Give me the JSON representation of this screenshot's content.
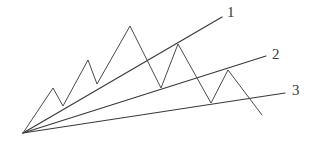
{
  "figure": {
    "background_color": "#ffffff",
    "line_color": "#3a3a3a",
    "zigzag_color": "#4a4a4a",
    "width": 318,
    "height": 145,
    "apex": {
      "x": 23,
      "y": 133
    }
  },
  "labels": {
    "line1": "1",
    "line2": "2",
    "line3": "3"
  },
  "chart_data": {
    "type": "line",
    "xlabel": "",
    "ylabel": "",
    "xlim": [
      0,
      318
    ],
    "ylim": [
      145,
      0
    ],
    "grid": false,
    "legend": "right-end-labels",
    "note": "Coordinates are in screen pixels; y increases downward.",
    "apex": {
      "x": 23,
      "y": 133
    },
    "series": [
      {
        "name": "1",
        "role": "upper-trendline",
        "label": "1",
        "label_position": {
          "x": 227,
          "y": 14
        },
        "points": [
          [
            23,
            133
          ],
          [
            222,
            17
          ]
        ]
      },
      {
        "name": "2",
        "role": "middle-trendline",
        "label": "2",
        "label_position": {
          "x": 272,
          "y": 56
        },
        "points": [
          [
            23,
            133
          ],
          [
            266,
            56
          ]
        ]
      },
      {
        "name": "3",
        "role": "lower-trendline",
        "label": "3",
        "label_position": {
          "x": 292,
          "y": 92
        },
        "points": [
          [
            23,
            133
          ],
          [
            285,
            93
          ]
        ]
      },
      {
        "name": "price-path",
        "role": "zigzag",
        "label": "",
        "points": [
          [
            23,
            133
          ],
          [
            53,
            88
          ],
          [
            63,
            106
          ],
          [
            88,
            60
          ],
          [
            97,
            84
          ],
          [
            130,
            26
          ],
          [
            161,
            88
          ],
          [
            178,
            44
          ],
          [
            211,
            103
          ],
          [
            228,
            70
          ],
          [
            262,
            115
          ]
        ]
      }
    ]
  }
}
